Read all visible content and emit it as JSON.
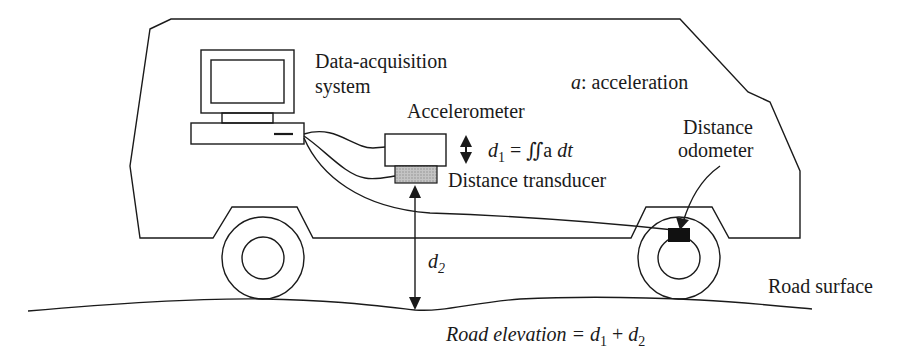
{
  "diagram": {
    "labels": {
      "data_acquisition_line1": "Data-acquisition",
      "data_acquisition_line2": "system",
      "accelerometer": "Accelerometer",
      "acceleration_var": "a",
      "acceleration_desc": ": acceleration",
      "d1_symbol": "d",
      "d1_sub": "1",
      "d1_formula": " = ∬ a dt",
      "d1_formula_pre": " = ∬a ",
      "d1_formula_post": "dt",
      "distance_transducer": "Distance transducer",
      "distance_odometer_line1": "Distance",
      "distance_odometer_line2": "odometer",
      "d2_symbol": "d",
      "d2_sub": "2",
      "road_surface": "Road surface",
      "road_elevation_pre": "Road elevation = ",
      "road_elevation_d": "d",
      "road_elevation_sub1": "1",
      "road_elevation_plus": " + ",
      "road_elevation_sub2": "2"
    },
    "colors": {
      "line": "#1a1a1a",
      "transducer_fill": "#b5b5b5",
      "odometer_fill": "#111111"
    }
  }
}
